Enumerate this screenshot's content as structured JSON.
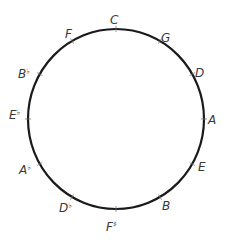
{
  "circle": {
    "cx": 116,
    "cy": 119,
    "rx": 88,
    "ry": 90,
    "stroke": "#1a1a1a",
    "stroke_width": 2.2
  },
  "notes": [
    {
      "name": "C",
      "base": "C",
      "accidental": "",
      "x": 110,
      "y": 24,
      "tick_angle": 0
    },
    {
      "name": "G",
      "base": "G",
      "accidental": "",
      "x": 161,
      "y": 42,
      "tick_angle": 30
    },
    {
      "name": "D",
      "base": "D",
      "accidental": "",
      "x": 195,
      "y": 77,
      "tick_angle": 60
    },
    {
      "name": "A",
      "base": "A",
      "accidental": "",
      "x": 208,
      "y": 124,
      "tick_angle": 90
    },
    {
      "name": "E",
      "base": "E",
      "accidental": "",
      "x": 198,
      "y": 171,
      "tick_angle": 120
    },
    {
      "name": "B",
      "base": "B",
      "accidental": "",
      "x": 162,
      "y": 210,
      "tick_angle": 150
    },
    {
      "name": "F♯",
      "base": "F",
      "accidental": "♯",
      "x": 106,
      "y": 231,
      "tick_angle": 180
    },
    {
      "name": "D♭",
      "base": "D",
      "accidental": "♭",
      "x": 59,
      "y": 212,
      "tick_angle": 210
    },
    {
      "name": "A♭",
      "base": "A",
      "accidental": "♭",
      "x": 19,
      "y": 174,
      "tick_angle": 240
    },
    {
      "name": "E♭",
      "base": "E",
      "accidental": "♭",
      "x": 9,
      "y": 119,
      "tick_angle": 270
    },
    {
      "name": "B♭",
      "base": "B",
      "accidental": "♭",
      "x": 18,
      "y": 78,
      "tick_angle": 300
    },
    {
      "name": "F",
      "base": "F",
      "accidental": "",
      "x": 65,
      "y": 38,
      "tick_angle": 330
    }
  ]
}
